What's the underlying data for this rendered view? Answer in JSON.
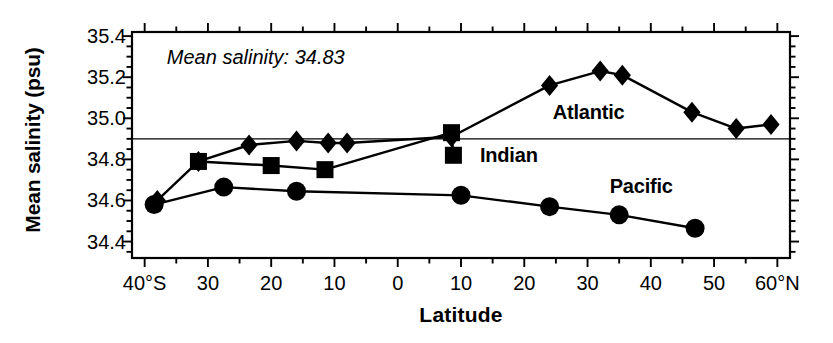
{
  "chart_data": {
    "type": "line",
    "title": "",
    "xlabel": "Latitude",
    "ylabel": "Mean salinity (psu)",
    "xlim": [
      -42,
      62
    ],
    "ylim": [
      34.32,
      35.42
    ],
    "grid": false,
    "legend_position": "inline-labels",
    "x_tick_labels": [
      "40°S",
      "30",
      "20",
      "10",
      "0",
      "10",
      "20",
      "30",
      "40",
      "50",
      "60°N"
    ],
    "x_tick_values": [
      -40,
      -30,
      -20,
      -10,
      0,
      10,
      20,
      30,
      40,
      50,
      60
    ],
    "x_minor_step": 5,
    "y_tick_labels": [
      "35.4",
      "35.2",
      "35.0",
      "34.8",
      "34.6",
      "34.4"
    ],
    "y_tick_values": [
      35.4,
      35.2,
      35.0,
      34.8,
      34.6,
      34.4
    ],
    "y_minor_step": 0.05,
    "annotations": [
      {
        "name": "mean-salinity-note",
        "text": "Mean salinity: 34.83",
        "x": -36.5,
        "y": 35.29
      }
    ],
    "reference_lines": [
      {
        "name": "mean-salinity-line",
        "orientation": "horizontal",
        "value": 34.9
      }
    ],
    "series": [
      {
        "name": "Atlantic",
        "marker": "diamond",
        "label_x": 24.5,
        "label_y": 35.02,
        "points": [
          {
            "x": -38.0,
            "y": 34.6
          },
          {
            "x": -31.5,
            "y": 34.79
          },
          {
            "x": -23.5,
            "y": 34.87
          },
          {
            "x": -16.0,
            "y": 34.89
          },
          {
            "x": -11.0,
            "y": 34.88
          },
          {
            "x": -8.0,
            "y": 34.88
          },
          {
            "x": 8.5,
            "y": 34.91
          },
          {
            "x": 24.0,
            "y": 35.16
          },
          {
            "x": 32.0,
            "y": 35.23
          },
          {
            "x": 35.5,
            "y": 35.21
          },
          {
            "x": 46.5,
            "y": 35.03
          },
          {
            "x": 53.5,
            "y": 34.95
          },
          {
            "x": 59.0,
            "y": 34.97
          }
        ]
      },
      {
        "name": "Indian",
        "marker": "square",
        "label_x": 13.0,
        "label_y": 34.81,
        "points": [
          {
            "x": -31.5,
            "y": 34.79
          },
          {
            "x": -20.0,
            "y": 34.77
          },
          {
            "x": -11.5,
            "y": 34.75
          },
          {
            "x": 8.5,
            "y": 34.93
          },
          {
            "x": 8.8,
            "y": 34.82
          }
        ]
      },
      {
        "name": "Pacific",
        "marker": "circle",
        "label_x": 33.5,
        "label_y": 34.66,
        "points": [
          {
            "x": -38.5,
            "y": 34.58
          },
          {
            "x": -27.5,
            "y": 34.665
          },
          {
            "x": -16.0,
            "y": 34.645
          },
          {
            "x": 10.0,
            "y": 34.625
          },
          {
            "x": 24.0,
            "y": 34.57
          },
          {
            "x": 35.0,
            "y": 34.53
          },
          {
            "x": 47.0,
            "y": 34.465
          }
        ]
      }
    ]
  }
}
